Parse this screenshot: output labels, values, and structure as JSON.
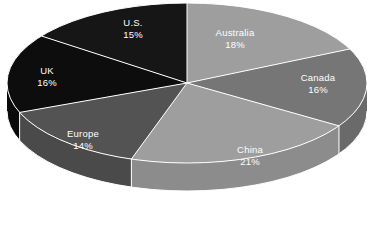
{
  "chart_data": {
    "type": "pie",
    "title": "",
    "subtitle": "",
    "xlabel": "",
    "ylabel": "",
    "legend_position": "none",
    "grid": false,
    "three_d": true,
    "start_angle_deg": 0,
    "direction": "clockwise",
    "categories": [
      "Australia",
      "Canada",
      "China",
      "Europe",
      "UK",
      "U.S."
    ],
    "values": [
      18,
      16,
      21,
      14,
      16,
      15
    ],
    "value_suffix": "%",
    "total": 100,
    "slices": [
      {
        "name": "Australia",
        "value": 18,
        "label": "Australia",
        "value_label": "18%",
        "top_color": "#9e9e9e",
        "side_color": "#8c8c8c",
        "label_x": 235,
        "label_y": 38
      },
      {
        "name": "Canada",
        "value": 16,
        "label": "Canada",
        "value_label": "16%",
        "top_color": "#767676",
        "side_color": "#6a6a6a",
        "label_x": 318,
        "label_y": 83
      },
      {
        "name": "China",
        "value": 21,
        "label": "China",
        "value_label": "21%",
        "top_color": "#9e9e9e",
        "side_color": "#8c8c8c",
        "label_x": 250,
        "label_y": 155
      },
      {
        "name": "Europe",
        "value": 14,
        "label": "Europe",
        "value_label": "14%",
        "top_color": "#535353",
        "side_color": "#4a4a4a",
        "label_x": 83,
        "label_y": 139
      },
      {
        "name": "UK",
        "value": 16,
        "label": "UK",
        "value_label": "16%",
        "top_color": "#0d0d0d",
        "side_color": "#0a0a0a",
        "label_x": 47,
        "label_y": 76
      },
      {
        "name": "U.S.",
        "value": 15,
        "label": "U.S.",
        "value_label": "15%",
        "top_color": "#161616",
        "side_color": "#101010",
        "label_x": 133,
        "label_y": 28
      }
    ],
    "colors": {
      "background": "#ffffff",
      "separator": "#ffffff",
      "label_text": "#ffffff"
    },
    "geometry": {
      "center_x": 187,
      "center_y": 83,
      "radius_x": 180,
      "radius_y": 80,
      "depth": 28
    }
  }
}
